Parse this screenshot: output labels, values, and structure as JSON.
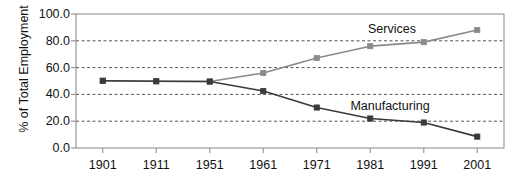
{
  "chart_data": {
    "type": "line",
    "title": "",
    "xlabel": "",
    "ylabel": "% of Total Employment",
    "categories": [
      "1901",
      "1911",
      "1951",
      "1961",
      "1971",
      "1981",
      "1991",
      "2001"
    ],
    "ylim": [
      0.0,
      100.0
    ],
    "y_ticks": [
      "0.0",
      "20.0",
      "40.0",
      "60.0",
      "80.0",
      "100.0"
    ],
    "y_tick_values": [
      0,
      20,
      40,
      60,
      80,
      100
    ],
    "grid": true,
    "grid_style": "dashed-horizontal",
    "legend": "inline-annotations",
    "series": [
      {
        "name": "Services",
        "color": "#8a8a8a",
        "marker": "square",
        "values": [
          50.2,
          49.8,
          49.6,
          56.0,
          67.2,
          76.0,
          79.0,
          88.0
        ]
      },
      {
        "name": "Manufacturing",
        "color": "#3a3a3a",
        "marker": "square",
        "values": [
          50.2,
          49.8,
          49.6,
          42.5,
          30.2,
          22.0,
          19.0,
          8.5
        ]
      }
    ],
    "annotations": [
      {
        "text": "Services",
        "x": "1981",
        "y": 90.0
      },
      {
        "text": "Manufacturing",
        "x": "1987",
        "y": 31.0
      }
    ]
  },
  "axes": {
    "y_title": "% of Total Employment",
    "y_labels": [
      "100.0",
      "80.0",
      "60.0",
      "40.0",
      "20.0",
      "0.0"
    ],
    "x_labels": [
      "1901",
      "1911",
      "1951",
      "1961",
      "1971",
      "1981",
      "1991",
      "2001"
    ]
  },
  "colors": {
    "services": "#8a8a8a",
    "manufacturing": "#3a3a3a",
    "grid": "#555555",
    "frame": "#999999",
    "text": "#111111",
    "background": "#ffffff"
  }
}
